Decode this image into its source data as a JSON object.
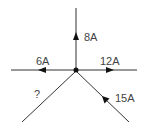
{
  "diagram": {
    "title": "",
    "type": "circuit-junction",
    "node": {
      "label": ""
    },
    "branches": [
      {
        "id": "up",
        "label": "8A",
        "direction": "out"
      },
      {
        "id": "left",
        "label": "6A",
        "direction": "out"
      },
      {
        "id": "right",
        "label": "12A",
        "direction": "out"
      },
      {
        "id": "lower-left",
        "label": "?",
        "direction": "unknown"
      },
      {
        "id": "lower-right",
        "label": "15A",
        "direction": "in"
      }
    ]
  },
  "colors": {
    "wire": "#333333",
    "arrow": "#111111",
    "text": "#444444"
  }
}
